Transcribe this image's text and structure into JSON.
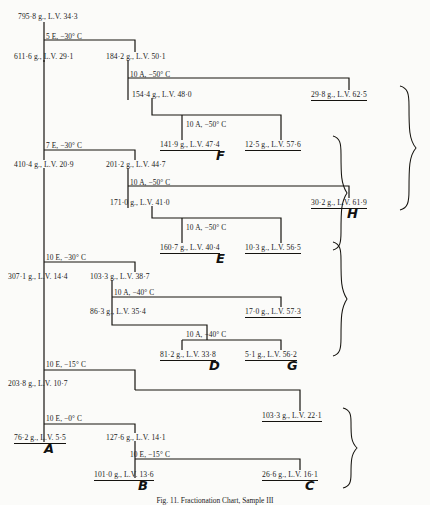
{
  "figure": {
    "caption": "Fig. 11. Fractionation Chart, Sample III",
    "units": {
      "mass": "g.",
      "viscosity": "L.V."
    }
  },
  "nodes": [
    {
      "id": "n0",
      "label": "795·8 g., L.V. 34·3",
      "x": 18,
      "y": 12,
      "terminal": false
    },
    {
      "id": "n1",
      "label": "611·6 g., L.V. 29·1",
      "x": 14,
      "y": 52,
      "terminal": false
    },
    {
      "id": "n2",
      "label": "184·2 g., L.V. 50·1",
      "x": 106,
      "y": 52,
      "terminal": false
    },
    {
      "id": "n3",
      "label": "154·4 g., L.V. 48·0",
      "x": 132,
      "y": 90,
      "terminal": false
    },
    {
      "id": "n4",
      "label": "29·8 g., L.V. 62·5",
      "x": 311,
      "y": 90,
      "terminal": true
    },
    {
      "id": "n5",
      "label": "141·9 g., L.V. 47·4",
      "x": 160,
      "y": 140,
      "terminal": true
    },
    {
      "id": "n6",
      "label": "12·5 g., L.V. 57·6",
      "x": 245,
      "y": 140,
      "terminal": true
    },
    {
      "id": "n7",
      "label": "410·4 g., L.V. 20·9",
      "x": 14,
      "y": 160,
      "terminal": false
    },
    {
      "id": "n8",
      "label": "201·2 g., L.V. 44·7",
      "x": 106,
      "y": 160,
      "terminal": false
    },
    {
      "id": "n9",
      "label": "171·0 g., L.V. 41·0",
      "x": 110,
      "y": 198,
      "terminal": false
    },
    {
      "id": "n10",
      "label": "30·2 g., L.V. 61·9",
      "x": 311,
      "y": 198,
      "terminal": true
    },
    {
      "id": "n11",
      "label": "160·7 g., L.V. 40·4",
      "x": 160,
      "y": 243,
      "terminal": true
    },
    {
      "id": "n12",
      "label": "10·3 g., L.V. 56·5",
      "x": 245,
      "y": 243,
      "terminal": true
    },
    {
      "id": "n13",
      "label": "307·1 g., L.V. 14·4",
      "x": 8,
      "y": 272,
      "terminal": false
    },
    {
      "id": "n14",
      "label": "103·3 g., L.V. 38·7",
      "x": 90,
      "y": 272,
      "terminal": false
    },
    {
      "id": "n15",
      "label": "86·3 g., L.V. 35·4",
      "x": 90,
      "y": 307,
      "terminal": false
    },
    {
      "id": "n16",
      "label": "17·0 g., L.V. 57·3",
      "x": 245,
      "y": 307,
      "terminal": true
    },
    {
      "id": "n17",
      "label": "81·2 g., L.V. 33·8",
      "x": 160,
      "y": 350,
      "terminal": true
    },
    {
      "id": "n18",
      "label": "5·1 g., L.V. 56·2",
      "x": 245,
      "y": 350,
      "terminal": true
    },
    {
      "id": "n19",
      "label": "203·8 g., L.V. 10·7",
      "x": 8,
      "y": 379,
      "terminal": false
    },
    {
      "id": "n20",
      "label": "103·3 g., L.V. 22·1",
      "x": 262,
      "y": 411,
      "terminal": true
    },
    {
      "id": "n21",
      "label": "76·2 g., L.V. 5·5",
      "x": 14,
      "y": 433,
      "terminal": true
    },
    {
      "id": "n22",
      "label": "127·6 g., L.V. 14·1",
      "x": 106,
      "y": 433,
      "terminal": false
    },
    {
      "id": "n23",
      "label": "101·0 g., L.V. 13·6",
      "x": 94,
      "y": 470,
      "terminal": true
    },
    {
      "id": "n24",
      "label": "26·6 g., L.V. 16·1",
      "x": 262,
      "y": 470,
      "terminal": true
    }
  ],
  "conditions": [
    {
      "id": "c0",
      "label": "5 E, −30° C",
      "x": 46,
      "y": 32
    },
    {
      "id": "c1",
      "label": "10 A, −50° C",
      "x": 130,
      "y": 70
    },
    {
      "id": "c2",
      "label": "10 A, −50° C",
      "x": 186,
      "y": 120
    },
    {
      "id": "c3",
      "label": "7 E, −30° C",
      "x": 46,
      "y": 141
    },
    {
      "id": "c4",
      "label": "10 A, −50° C",
      "x": 130,
      "y": 178
    },
    {
      "id": "c5",
      "label": "10 A, −50° C",
      "x": 186,
      "y": 223
    },
    {
      "id": "c6",
      "label": "10 E, −30° C",
      "x": 46,
      "y": 253
    },
    {
      "id": "c7",
      "label": "10 A, −40° C",
      "x": 114,
      "y": 288
    },
    {
      "id": "c8",
      "label": "10 A, −40° C",
      "x": 186,
      "y": 330
    },
    {
      "id": "c9",
      "label": "10 E, −15° C",
      "x": 46,
      "y": 360
    },
    {
      "id": "c10",
      "label": "10 E, −0° C",
      "x": 46,
      "y": 414
    },
    {
      "id": "c11",
      "label": "10 E, −15° C",
      "x": 130,
      "y": 450
    }
  ],
  "fraction_labels": [
    {
      "letter": "F",
      "x": 216,
      "y": 148
    },
    {
      "letter": "H",
      "x": 347,
      "y": 206
    },
    {
      "letter": "E",
      "x": 216,
      "y": 251
    },
    {
      "letter": "D",
      "x": 209,
      "y": 358
    },
    {
      "letter": "G",
      "x": 287,
      "y": 358
    },
    {
      "letter": "A",
      "x": 44,
      "y": 441
    },
    {
      "letter": "B",
      "x": 138,
      "y": 478
    },
    {
      "letter": "C",
      "x": 305,
      "y": 478
    }
  ]
}
